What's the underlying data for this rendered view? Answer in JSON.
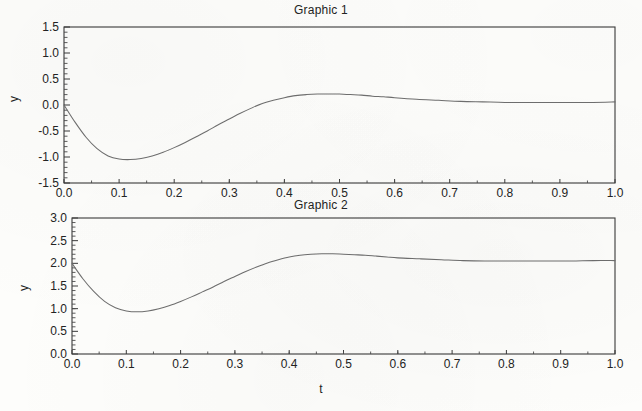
{
  "figure": {
    "background_color": "#fdfdfb",
    "axis_color": "#3a3a3a",
    "curve_color": "#6e6e6e",
    "text_color": "#232323"
  },
  "panels": [
    {
      "id": "graphic-1",
      "title": "Graphic 1",
      "ylabel": "y",
      "xlabel": "",
      "x_ticks": [
        "0.0",
        "0.1",
        "0.2",
        "0.3",
        "0.4",
        "0.5",
        "0.6",
        "0.7",
        "0.8",
        "0.9",
        "1.0"
      ],
      "y_ticks": [
        "-1.5",
        "-1.0",
        "-0.5",
        "0.0",
        "0.5",
        "1.0",
        "1.5"
      ]
    },
    {
      "id": "graphic-2",
      "title": "Graphic 2",
      "ylabel": "y",
      "xlabel": "t",
      "x_ticks": [
        "0.0",
        "0.1",
        "0.2",
        "0.3",
        "0.4",
        "0.5",
        "0.6",
        "0.7",
        "0.8",
        "0.9",
        "1.0"
      ],
      "y_ticks": [
        "0.0",
        "0.5",
        "1.0",
        "1.5",
        "2.0",
        "2.5",
        "3.0"
      ]
    }
  ],
  "chart_data": [
    {
      "type": "line",
      "title": "Graphic 1",
      "xlabel": "",
      "ylabel": "y",
      "xlim": [
        0.0,
        1.0
      ],
      "ylim": [
        -1.5,
        1.5
      ],
      "xticks": [
        0.0,
        0.1,
        0.2,
        0.3,
        0.4,
        0.5,
        0.6,
        0.7,
        0.8,
        0.9,
        1.0
      ],
      "yticks": [
        -1.5,
        -1.0,
        -0.5,
        0.0,
        0.5,
        1.0,
        1.5
      ],
      "minor_ticks": true,
      "grid": false,
      "legend": null,
      "series": [
        {
          "name": "y(t)",
          "x": [
            0.0,
            0.02,
            0.04,
            0.06,
            0.08,
            0.1,
            0.12,
            0.14,
            0.16,
            0.18,
            0.2,
            0.22,
            0.24,
            0.26,
            0.28,
            0.3,
            0.32,
            0.34,
            0.36,
            0.38,
            0.4,
            0.42,
            0.44,
            0.46,
            0.48,
            0.5,
            0.52,
            0.54,
            0.56,
            0.58,
            0.6,
            0.64,
            0.68,
            0.72,
            0.76,
            0.8,
            0.84,
            0.88,
            0.92,
            0.96,
            1.0
          ],
          "y": [
            0.0,
            -0.33,
            -0.62,
            -0.84,
            -0.98,
            -1.04,
            -1.05,
            -1.03,
            -0.98,
            -0.91,
            -0.82,
            -0.72,
            -0.61,
            -0.5,
            -0.38,
            -0.27,
            -0.16,
            -0.06,
            0.03,
            0.09,
            0.14,
            0.18,
            0.2,
            0.21,
            0.21,
            0.21,
            0.2,
            0.19,
            0.17,
            0.16,
            0.14,
            0.11,
            0.09,
            0.07,
            0.06,
            0.05,
            0.05,
            0.05,
            0.05,
            0.05,
            0.06
          ]
        }
      ],
      "annotations": {
        "start_value": 0.0,
        "minimum": {
          "t": 0.12,
          "y": -1.05
        },
        "maximum": {
          "t": 0.48,
          "y": 0.21
        },
        "steady_state": 0.06
      }
    },
    {
      "type": "line",
      "title": "Graphic 2",
      "xlabel": "t",
      "ylabel": "y",
      "xlim": [
        0.0,
        1.0
      ],
      "ylim": [
        0.0,
        3.0
      ],
      "xticks": [
        0.0,
        0.1,
        0.2,
        0.3,
        0.4,
        0.5,
        0.6,
        0.7,
        0.8,
        0.9,
        1.0
      ],
      "yticks": [
        0.0,
        0.5,
        1.0,
        1.5,
        2.0,
        2.5,
        3.0
      ],
      "minor_ticks": true,
      "grid": false,
      "legend": null,
      "series": [
        {
          "name": "y(t)",
          "x": [
            0.0,
            0.02,
            0.04,
            0.06,
            0.08,
            0.1,
            0.12,
            0.14,
            0.16,
            0.18,
            0.2,
            0.22,
            0.24,
            0.26,
            0.28,
            0.3,
            0.32,
            0.34,
            0.36,
            0.38,
            0.4,
            0.42,
            0.44,
            0.46,
            0.48,
            0.5,
            0.52,
            0.54,
            0.56,
            0.58,
            0.6,
            0.64,
            0.68,
            0.72,
            0.76,
            0.8,
            0.84,
            0.88,
            0.92,
            0.96,
            1.0
          ],
          "y": [
            2.0,
            1.66,
            1.38,
            1.16,
            1.02,
            0.95,
            0.93,
            0.95,
            1.0,
            1.07,
            1.16,
            1.26,
            1.37,
            1.48,
            1.6,
            1.71,
            1.82,
            1.92,
            2.01,
            2.08,
            2.14,
            2.18,
            2.2,
            2.21,
            2.21,
            2.2,
            2.19,
            2.18,
            2.16,
            2.14,
            2.12,
            2.1,
            2.08,
            2.06,
            2.05,
            2.05,
            2.05,
            2.05,
            2.05,
            2.06,
            2.06
          ]
        }
      ],
      "annotations": {
        "start_value": 2.0,
        "minimum": {
          "t": 0.115,
          "y": 0.93
        },
        "maximum": {
          "t": 0.47,
          "y": 2.21
        },
        "steady_state": 2.06
      }
    }
  ]
}
